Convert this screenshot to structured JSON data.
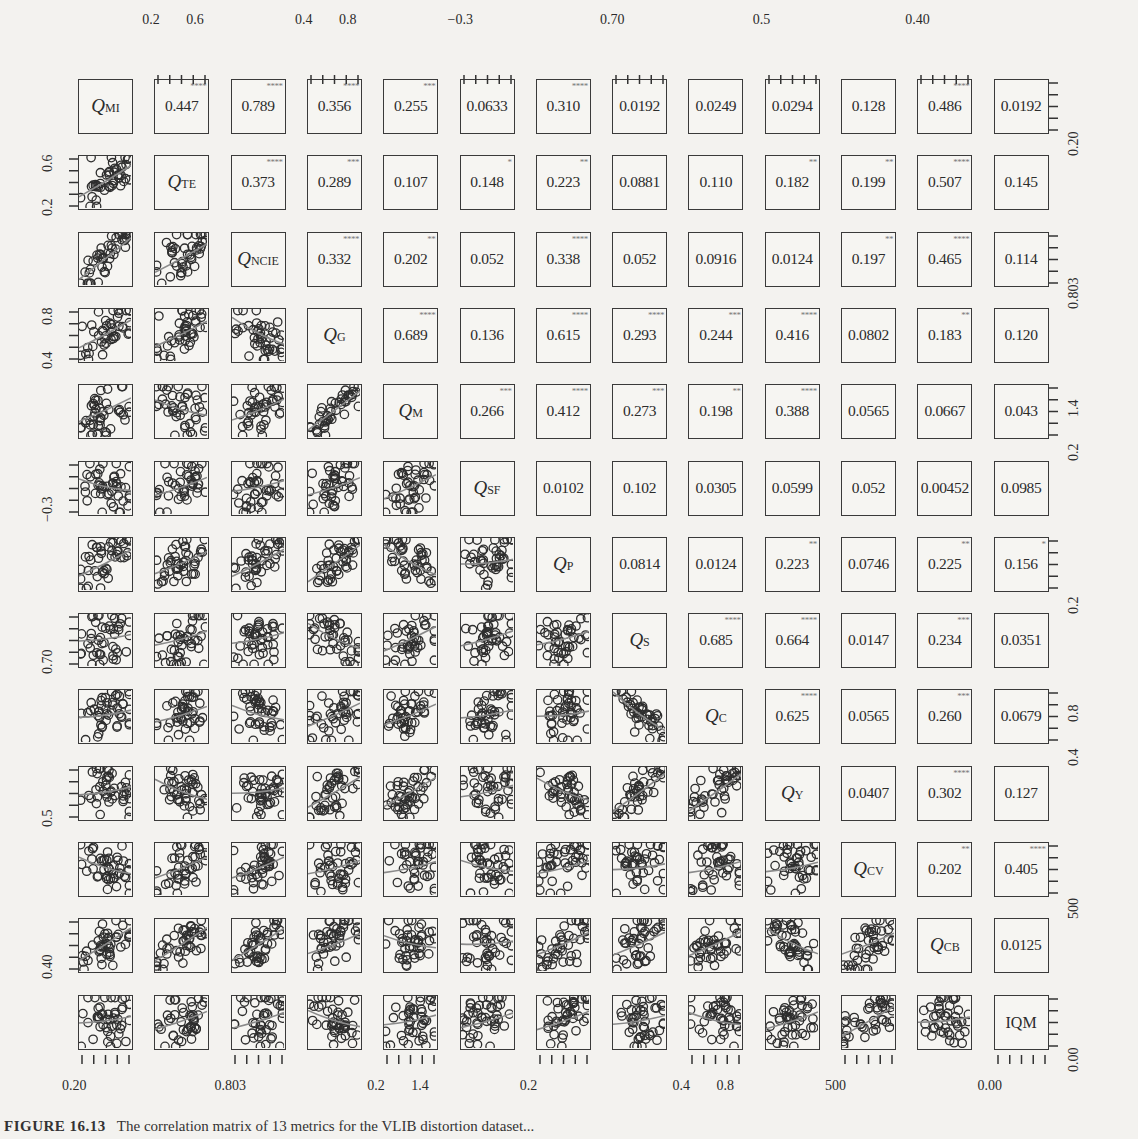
{
  "chart_data": {
    "type": "scatter-matrix",
    "variables": [
      {
        "name": "Q",
        "sub": "MI"
      },
      {
        "name": "Q",
        "sub": "TE"
      },
      {
        "name": "Q",
        "sub": "NCIE"
      },
      {
        "name": "Q",
        "sub": "G"
      },
      {
        "name": "Q",
        "sub": "M"
      },
      {
        "name": "Q",
        "sub": "SF"
      },
      {
        "name": "Q",
        "sub": "P"
      },
      {
        "name": "Q",
        "sub": "S"
      },
      {
        "name": "Q",
        "sub": "C"
      },
      {
        "name": "Q",
        "sub": "Y"
      },
      {
        "name": "Q",
        "sub": "CV"
      },
      {
        "name": "Q",
        "sub": "CB"
      },
      {
        "name": "IQM",
        "sub": ""
      }
    ],
    "correlations": [
      [
        null,
        0.447,
        0.789,
        0.356,
        0.255,
        0.0633,
        0.31,
        0.0192,
        0.0249,
        0.0294,
        0.128,
        0.486,
        0.0192
      ],
      [
        null,
        null,
        0.373,
        0.289,
        0.107,
        0.148,
        0.223,
        0.0881,
        0.11,
        0.182,
        0.199,
        0.507,
        0.145
      ],
      [
        null,
        null,
        null,
        0.332,
        0.202,
        0.052,
        0.338,
        0.052,
        0.0916,
        0.0124,
        0.197,
        0.465,
        0.114
      ],
      [
        null,
        null,
        null,
        null,
        0.689,
        0.136,
        0.615,
        0.293,
        0.244,
        0.416,
        0.0802,
        0.183,
        0.12
      ],
      [
        null,
        null,
        null,
        null,
        null,
        0.266,
        0.412,
        0.273,
        0.198,
        0.388,
        0.0565,
        0.0667,
        0.043
      ],
      [
        null,
        null,
        null,
        null,
        null,
        null,
        0.0102,
        0.102,
        0.0305,
        0.0599,
        0.052,
        0.00452,
        0.0985
      ],
      [
        null,
        null,
        null,
        null,
        null,
        null,
        null,
        0.0814,
        0.0124,
        0.223,
        0.0746,
        0.225,
        0.156
      ],
      [
        null,
        null,
        null,
        null,
        null,
        null,
        null,
        null,
        0.685,
        0.664,
        0.0147,
        0.234,
        0.0351
      ],
      [
        null,
        null,
        null,
        null,
        null,
        null,
        null,
        null,
        null,
        0.625,
        0.0565,
        0.26,
        0.0679
      ],
      [
        null,
        null,
        null,
        null,
        null,
        null,
        null,
        null,
        null,
        null,
        0.0407,
        0.302,
        0.127
      ],
      [
        null,
        null,
        null,
        null,
        null,
        null,
        null,
        null,
        null,
        null,
        null,
        0.202,
        0.405
      ],
      [
        null,
        null,
        null,
        null,
        null,
        null,
        null,
        null,
        null,
        null,
        null,
        null,
        0.0125
      ],
      [
        null,
        null,
        null,
        null,
        null,
        null,
        null,
        null,
        null,
        null,
        null,
        null,
        null
      ]
    ],
    "labels": [
      [
        "",
        "0.447",
        "0.789",
        "0.356",
        "0.255",
        "0.0633",
        "0.310",
        "0.0192",
        "0.0249",
        "0.0294",
        "0.128",
        "0.486",
        "0.0192"
      ],
      [
        "",
        "",
        "0.373",
        "0.289",
        "0.107",
        "0.148",
        "0.223",
        "0.0881",
        "0.110",
        "0.182",
        "0.199",
        "0.507",
        "0.145"
      ],
      [
        "",
        "",
        "",
        "0.332",
        "0.202",
        "0.052",
        "0.338",
        "0.052",
        "0.0916",
        "0.0124",
        "0.197",
        "0.465",
        "0.114"
      ],
      [
        "",
        "",
        "",
        "",
        "0.689",
        "0.136",
        "0.615",
        "0.293",
        "0.244",
        "0.416",
        "0.0802",
        "0.183",
        "0.120"
      ],
      [
        "",
        "",
        "",
        "",
        "",
        "0.266",
        "0.412",
        "0.273",
        "0.198",
        "0.388",
        "0.0565",
        "0.0667",
        "0.043"
      ],
      [
        "",
        "",
        "",
        "",
        "",
        "",
        "0.0102",
        "0.102",
        "0.0305",
        "0.0599",
        "0.052",
        "0.00452",
        "0.0985"
      ],
      [
        "",
        "",
        "",
        "",
        "",
        "",
        "",
        "0.0814",
        "0.0124",
        "0.223",
        "0.0746",
        "0.225",
        "0.156"
      ],
      [
        "",
        "",
        "",
        "",
        "",
        "",
        "",
        "",
        "0.685",
        "0.664",
        "0.0147",
        "0.234",
        "0.0351"
      ],
      [
        "",
        "",
        "",
        "",
        "",
        "",
        "",
        "",
        "",
        "0.625",
        "0.0565",
        "0.260",
        "0.0679"
      ],
      [
        "",
        "",
        "",
        "",
        "",
        "",
        "",
        "",
        "",
        "",
        "0.0407",
        "0.302",
        "0.127"
      ],
      [
        "",
        "",
        "",
        "",
        "",
        "",
        "",
        "",
        "",
        "",
        "",
        "0.202",
        "0.405"
      ],
      [
        "",
        "",
        "",
        "",
        "",
        "",
        "",
        "",
        "",
        "",
        "",
        "",
        "0.0125"
      ],
      [
        "",
        "",
        "",
        "",
        "",
        "",
        "",
        "",
        "",
        "",
        "",
        "",
        ""
      ]
    ],
    "significance": [
      [
        "",
        "****",
        "****",
        "****",
        "***",
        "",
        "****",
        "",
        "",
        "",
        "",
        "****",
        ""
      ],
      [
        "",
        "",
        "****",
        "***",
        "",
        "*",
        "**",
        "",
        "",
        "**",
        "**",
        "****",
        ""
      ],
      [
        "",
        "",
        "",
        "****",
        "**",
        "",
        "****",
        "",
        "",
        "",
        "**",
        "****",
        ""
      ],
      [
        "",
        "",
        "",
        "",
        "****",
        "",
        "****",
        "****",
        "***",
        "****",
        "",
        "**",
        ""
      ],
      [
        "",
        "",
        "",
        "",
        "",
        "***",
        "****",
        "***",
        "**",
        "****",
        "",
        "",
        ""
      ],
      [
        "",
        "",
        "",
        "",
        "",
        "",
        "",
        "",
        "",
        "",
        "",
        "",
        ""
      ],
      [
        "",
        "",
        "",
        "",
        "",
        "",
        "",
        "",
        "",
        "**",
        "",
        "**",
        "*"
      ],
      [
        "",
        "",
        "",
        "",
        "",
        "",
        "",
        "",
        "****",
        "****",
        "",
        "***",
        ""
      ],
      [
        "",
        "",
        "",
        "",
        "",
        "",
        "",
        "",
        "",
        "****",
        "",
        "***",
        ""
      ],
      [
        "",
        "",
        "",
        "",
        "",
        "",
        "",
        "",
        "",
        "",
        "",
        "****",
        ""
      ],
      [
        "",
        "",
        "",
        "",
        "",
        "",
        "",
        "",
        "",
        "",
        "",
        "**",
        "****"
      ],
      [
        "",
        "",
        "",
        "",
        "",
        "",
        "",
        "",
        "",
        "",
        "",
        "",
        ""
      ],
      [
        "",
        "",
        "",
        "",
        "",
        "",
        "",
        "",
        "",
        "",
        "",
        "",
        ""
      ]
    ],
    "top_axis_ticks": [
      {
        "col": 1,
        "labels": [
          "0.2",
          "0.6"
        ]
      },
      {
        "col": 3,
        "labels": [
          "0.4",
          "0.8"
        ]
      },
      {
        "col": 5,
        "labels": [
          "−0.3"
        ]
      },
      {
        "col": 7,
        "labels": [
          "0.70"
        ]
      },
      {
        "col": 9,
        "labels": [
          "0.5"
        ]
      },
      {
        "col": 11,
        "labels": [
          "0.40"
        ]
      }
    ],
    "bottom_axis_ticks": [
      {
        "col": 0,
        "labels": [
          "0.20"
        ]
      },
      {
        "col": 2,
        "labels": [
          "0.803"
        ]
      },
      {
        "col": 4,
        "labels": [
          "0.2",
          "1.4"
        ]
      },
      {
        "col": 6,
        "labels": [
          "0.2"
        ]
      },
      {
        "col": 8,
        "labels": [
          "0.4",
          "0.8"
        ]
      },
      {
        "col": 10,
        "labels": [
          "500"
        ]
      },
      {
        "col": 12,
        "labels": [
          "0.00"
        ]
      }
    ],
    "left_axis_ticks": [
      {
        "row": 1,
        "labels": [
          "0.2",
          "0.6"
        ]
      },
      {
        "row": 3,
        "labels": [
          "0.4",
          "0.8"
        ]
      },
      {
        "row": 5,
        "labels": [
          "−0.3"
        ]
      },
      {
        "row": 7,
        "labels": [
          "0.70"
        ]
      },
      {
        "row": 9,
        "labels": [
          "0.5"
        ]
      },
      {
        "row": 11,
        "labels": [
          "0.40"
        ]
      }
    ],
    "right_axis_ticks": [
      {
        "row": 0,
        "labels": [
          "0.20"
        ]
      },
      {
        "row": 2,
        "labels": [
          "0.803"
        ]
      },
      {
        "row": 4,
        "labels": [
          "0.2",
          "1.4"
        ]
      },
      {
        "row": 6,
        "labels": [
          "0.2"
        ]
      },
      {
        "row": 8,
        "labels": [
          "0.4",
          "0.8"
        ]
      },
      {
        "row": 10,
        "labels": [
          "500"
        ]
      },
      {
        "row": 12,
        "labels": [
          "0.00"
        ]
      }
    ],
    "lower_triangle": "scatter plots with smoothed trend lines",
    "upper_triangle": "correlation coefficients with significance stars"
  },
  "caption": {
    "label": "FIGURE 16.13",
    "text": "The correlation matrix of 13 metrics for the VLIB distortion dataset..."
  },
  "colors": {
    "background": "#f3f2ef",
    "ink": "#2b2b2b",
    "stars": "#777777",
    "trend": "#8a8a8a"
  }
}
